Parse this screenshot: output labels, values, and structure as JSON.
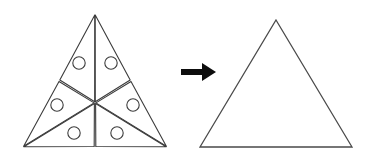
{
  "figure": {
    "title": "",
    "background_color": "#ffffff",
    "stroke_color": "#3c3c3c",
    "arrow_color": "#0d0d0d"
  },
  "left_shape": {
    "name": "segmented-triangle",
    "label": "",
    "outline": {
      "apex": {
        "x": 95,
        "y": 14
      },
      "bottom_left": {
        "x": 23,
        "y": 147
      },
      "bottom_right": {
        "x": 167,
        "y": 147
      }
    },
    "centroid": {
      "x": 95,
      "y": 102.7
    },
    "piece_count": 6,
    "gap": 1.9,
    "pieces": [
      {
        "id": "piece-top-left",
        "circle": {
          "cx": 79,
          "cy": 63,
          "r": 6.2
        }
      },
      {
        "id": "piece-top-right",
        "circle": {
          "cx": 111,
          "cy": 63,
          "r": 6.2
        }
      },
      {
        "id": "piece-mid-left",
        "circle": {
          "cx": 57,
          "cy": 105,
          "r": 6.2
        }
      },
      {
        "id": "piece-mid-right",
        "circle": {
          "cx": 133,
          "cy": 105,
          "r": 6.2
        }
      },
      {
        "id": "piece-bottom-left",
        "circle": {
          "cx": 74,
          "cy": 133,
          "r": 6.2
        }
      },
      {
        "id": "piece-bottom-right",
        "circle": {
          "cx": 117,
          "cy": 133,
          "r": 6.2
        }
      }
    ],
    "circle_count": 6
  },
  "arrow": {
    "name": "rightward-arrow",
    "label": "",
    "direction": "right",
    "shaft": {
      "x1": 181,
      "y1": 72,
      "x2": 203,
      "y2": 72,
      "thickness": 6
    },
    "head": {
      "tip_x": 216,
      "tip_y": 72,
      "base_x": 202,
      "half_height": 9
    }
  },
  "right_shape": {
    "name": "plain-triangle",
    "label": "",
    "outline": {
      "apex": {
        "x": 276,
        "y": 20
      },
      "bottom_left": {
        "x": 200,
        "y": 147
      },
      "bottom_right": {
        "x": 352,
        "y": 147
      }
    },
    "piece_count": 1,
    "circle_count": 0
  }
}
